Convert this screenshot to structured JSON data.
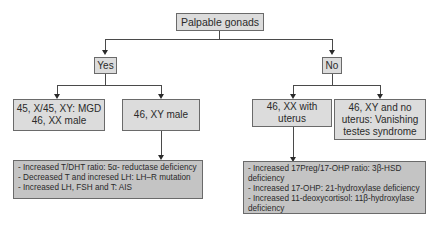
{
  "diagram": {
    "root": {
      "label": "Palpable gonads"
    },
    "yes_branch": {
      "label": "Yes",
      "children": [
        {
          "lines": [
            "45, X/45, XY: MGD",
            "46, XX male"
          ]
        },
        {
          "lines": [
            "46, XY male"
          ]
        }
      ],
      "detail": {
        "items": [
          "- Increased T/DHT ratio: 5α- reductase deficiency",
          "- Decreased T and incresed LH: LH–R mutation",
          "- Increased LH, FSH and T: AIS"
        ]
      }
    },
    "no_branch": {
      "label": "No",
      "children": [
        {
          "lines": [
            "46, XX with",
            "uterus"
          ]
        },
        {
          "lines": [
            "46, XY and no",
            "uterus: Vanishing",
            "testes syndrome"
          ]
        }
      ],
      "detail": {
        "items": [
          "- Increased 17Preg/17-OHP ratio: 3β-HSD deficiency",
          "- Increased 17-OHP: 21-hydroxylase deficiency",
          "- Increased 11-deoxycortisol: 11β-hydroxylase deficiency"
        ]
      }
    }
  }
}
